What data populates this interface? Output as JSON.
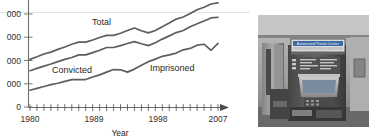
{
  "figure": {
    "panels": [
      "line-chart",
      "photograph"
    ]
  },
  "chart_data": {
    "type": "line",
    "title": "",
    "xlabel": "Year",
    "ylabel": "",
    "grid": true,
    "legend": "inline-labels",
    "xlim": [
      1980,
      2007
    ],
    "ylim": [
      0,
      5000
    ],
    "xticklabels": [
      "1980",
      "1989",
      "1998",
      "2007"
    ],
    "xticklabel_years": [
      1980,
      1989,
      1998,
      2007
    ],
    "xtick_years": [
      1980,
      1981,
      1982,
      1983,
      1984,
      1985,
      1986,
      1987,
      1988,
      1989,
      1990,
      1991,
      1992,
      1993,
      1994,
      1995,
      1996,
      1997,
      1998,
      1999,
      2000,
      2001,
      2002,
      2003,
      2004,
      2005,
      2006,
      2007
    ],
    "yticklabels": [
      "0",
      "000",
      "000",
      "000",
      "000"
    ],
    "ytickvalues": [
      0,
      1000,
      2000,
      3000,
      4000
    ],
    "ytick_note": "leading digit cropped at left image edge",
    "x": [
      1980,
      1981,
      1982,
      1983,
      1984,
      1985,
      1986,
      1987,
      1988,
      1989,
      1990,
      1991,
      1992,
      1993,
      1994,
      1995,
      1996,
      1997,
      1998,
      1999,
      2000,
      2001,
      2002,
      2003,
      2004,
      2005,
      2006,
      2007
    ],
    "series": [
      {
        "name": "Total",
        "label": "Total",
        "color": "#5e5e5e",
        "values": [
          2050,
          2160,
          2280,
          2360,
          2480,
          2580,
          2700,
          2790,
          2790,
          2880,
          2990,
          3080,
          3080,
          3170,
          3290,
          3400,
          3280,
          3190,
          3290,
          3450,
          3610,
          3780,
          3870,
          4020,
          4180,
          4290,
          4430,
          4480
        ]
      },
      {
        "name": "Convicted",
        "label": "Convicted",
        "color": "#5e5e5e",
        "values": [
          1560,
          1660,
          1760,
          1850,
          1950,
          2050,
          2130,
          2240,
          2240,
          2340,
          2440,
          2560,
          2560,
          2640,
          2730,
          2810,
          2720,
          2640,
          2760,
          2920,
          3060,
          3200,
          3290,
          3450,
          3580,
          3700,
          3830,
          3860
        ]
      },
      {
        "name": "Imprisoned",
        "label": "Imprisoned",
        "color": "#5e5e5e",
        "values": [
          720,
          800,
          880,
          960,
          1020,
          1100,
          1180,
          1180,
          1180,
          1290,
          1380,
          1500,
          1610,
          1600,
          1500,
          1630,
          1800,
          1950,
          2060,
          2180,
          2240,
          2320,
          2460,
          2520,
          2660,
          2700,
          2440,
          2740
        ]
      }
    ],
    "annotations": [
      {
        "text": "Total",
        "x_px": 92,
        "y_px": 25
      },
      {
        "text": "Convicted",
        "x_px": 52,
        "y_px": 73
      },
      {
        "text": "Imprisoned",
        "x_px": 150,
        "y_px": 71
      }
    ]
  },
  "photo": {
    "alt": "Automated Postal Center self-service kiosk in a post office lobby",
    "sign_text": "Automated Postal Center",
    "sign_subtext": "",
    "caption": ""
  }
}
